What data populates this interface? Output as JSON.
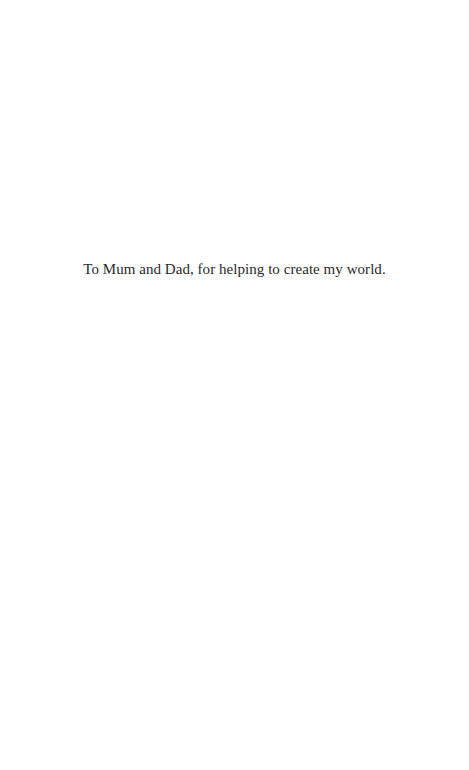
{
  "page": {
    "dedication": "To Mum and Dad, for helping to create my world."
  }
}
